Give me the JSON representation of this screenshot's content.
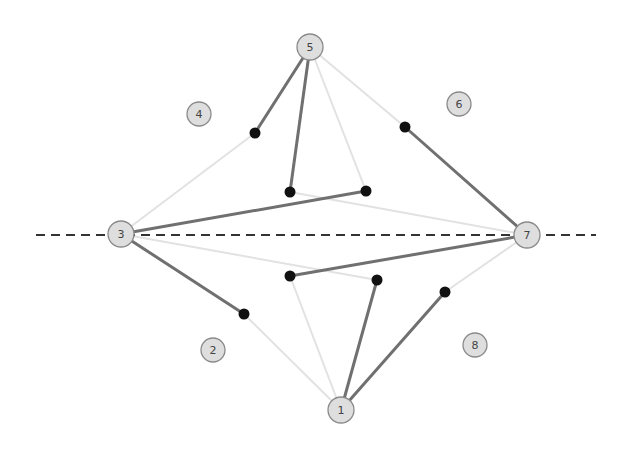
{
  "diagram": {
    "axis": {
      "x1": 36,
      "y1": 235,
      "x2": 596,
      "y2": 235,
      "style": "dashed"
    },
    "nodes": [
      {
        "id": "5",
        "label": "5",
        "x": 310,
        "y": 47,
        "r": 13
      },
      {
        "id": "3",
        "label": "3",
        "x": 121,
        "y": 234,
        "r": 13
      },
      {
        "id": "7",
        "label": "7",
        "x": 527,
        "y": 235,
        "r": 13
      },
      {
        "id": "1",
        "label": "1",
        "x": 341,
        "y": 410,
        "r": 13
      },
      {
        "id": "4",
        "label": "4",
        "x": 199,
        "y": 114,
        "r": 12
      },
      {
        "id": "6",
        "label": "6",
        "x": 459,
        "y": 104,
        "r": 12
      },
      {
        "id": "2",
        "label": "2",
        "x": 213,
        "y": 350,
        "r": 12
      },
      {
        "id": "8",
        "label": "8",
        "x": 475,
        "y": 345,
        "r": 12
      }
    ],
    "points": [
      {
        "x": 255,
        "y": 133
      },
      {
        "x": 290,
        "y": 192
      },
      {
        "x": 366,
        "y": 191
      },
      {
        "x": 405,
        "y": 127
      },
      {
        "x": 290,
        "y": 276
      },
      {
        "x": 377,
        "y": 280
      },
      {
        "x": 445,
        "y": 292
      },
      {
        "x": 244,
        "y": 314
      }
    ],
    "dark_edges": [
      {
        "x1": 310,
        "y1": 47,
        "x2": 255,
        "y2": 133
      },
      {
        "x1": 310,
        "y1": 47,
        "x2": 290,
        "y2": 192
      },
      {
        "x1": 121,
        "y1": 234,
        "x2": 366,
        "y2": 191
      },
      {
        "x1": 121,
        "y1": 234,
        "x2": 244,
        "y2": 314
      },
      {
        "x1": 527,
        "y1": 235,
        "x2": 405,
        "y2": 127
      },
      {
        "x1": 527,
        "y1": 235,
        "x2": 290,
        "y2": 276
      },
      {
        "x1": 341,
        "y1": 410,
        "x2": 377,
        "y2": 280
      },
      {
        "x1": 341,
        "y1": 410,
        "x2": 445,
        "y2": 292
      }
    ],
    "light_edges": [
      {
        "x1": 121,
        "y1": 234,
        "x2": 255,
        "y2": 133
      },
      {
        "x1": 310,
        "y1": 47,
        "x2": 366,
        "y2": 191
      },
      {
        "x1": 310,
        "y1": 47,
        "x2": 405,
        "y2": 127
      },
      {
        "x1": 290,
        "y1": 192,
        "x2": 527,
        "y2": 235
      },
      {
        "x1": 121,
        "y1": 234,
        "x2": 377,
        "y2": 280
      },
      {
        "x1": 290,
        "y1": 276,
        "x2": 341,
        "y2": 410
      },
      {
        "x1": 244,
        "y1": 314,
        "x2": 341,
        "y2": 410
      },
      {
        "x1": 445,
        "y1": 292,
        "x2": 527,
        "y2": 235
      }
    ]
  }
}
